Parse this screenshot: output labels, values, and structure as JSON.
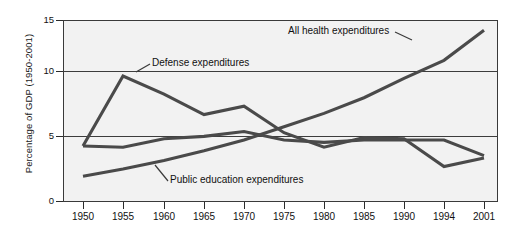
{
  "chart_data": {
    "type": "line",
    "title": "",
    "xlabel": "",
    "ylabel": "Percentage of GDP (1950-2001)",
    "categories": [
      "1950",
      "1955",
      "1960",
      "1965",
      "1970",
      "1975",
      "1980",
      "1985",
      "1990",
      "1994",
      "2001"
    ],
    "x_tick_labels": [
      "1950",
      "1955",
      "1960",
      "1965",
      "1970",
      "1975",
      "1980",
      "1985",
      "1990",
      "1994",
      "2001"
    ],
    "y_tick_labels": [
      "0",
      "5",
      "10",
      "15"
    ],
    "y_ticks": [
      0,
      5,
      10,
      15
    ],
    "ylim": [
      0,
      15
    ],
    "grid": "horizontal gridlines at 5 and 10",
    "legend": "inline annotations with leader lines",
    "series": [
      {
        "name": "Defense expenditures",
        "values": [
          4.6,
          10.4,
          8.9,
          7.2,
          7.9,
          5.7,
          4.5,
          5.3,
          5.2,
          2.9,
          3.6
        ]
      },
      {
        "name": "All health expenditures",
        "values": [
          2.1,
          2.7,
          3.4,
          4.2,
          5.1,
          6.2,
          7.3,
          8.6,
          10.2,
          11.7,
          14.2
        ]
      },
      {
        "name": "Public education expenditures",
        "values": [
          4.6,
          4.5,
          5.2,
          5.4,
          5.8,
          5.1,
          4.9,
          5.1,
          5.1,
          5.1,
          3.8
        ]
      }
    ],
    "annotations": [
      {
        "name": "defense-label",
        "text": "Defense expenditures"
      },
      {
        "name": "health-label",
        "text": "All health expenditures"
      },
      {
        "name": "education-label",
        "text": "Public education expenditures"
      }
    ]
  },
  "axis": {
    "y_title": "Percentage of GDP (1950-2001)",
    "y_labels": [
      "15",
      "10",
      "5",
      "0"
    ],
    "x_labels": [
      "1950",
      "1955",
      "1960",
      "1965",
      "1970",
      "1975",
      "1980",
      "1985",
      "1990",
      "1994",
      "2001"
    ]
  },
  "labels": {
    "defense": "Defense expenditures",
    "health": "All health expenditures",
    "education": "Public education expenditures"
  },
  "colors": {
    "series_stroke": "#4a4a4a",
    "plot_background": "#f2f2f2",
    "axis": "#2b2b2b",
    "text": "#111111"
  }
}
